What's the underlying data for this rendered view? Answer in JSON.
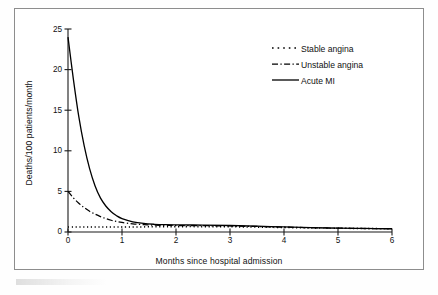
{
  "figure": {
    "border_color": "#8d8d8d",
    "background": "#ffffff",
    "ink_color": "#000000"
  },
  "chart_data": {
    "type": "line",
    "title": "",
    "subtitle": "",
    "xlabel": "Months since hospital admission",
    "ylabel": "Deaths/100 patients/month",
    "xlim": [
      0,
      6
    ],
    "ylim": [
      0,
      25
    ],
    "xticks": [
      0,
      1,
      2,
      3,
      4,
      5,
      6
    ],
    "yticks": [
      0,
      5,
      10,
      15,
      20,
      25
    ],
    "xtick_labels": [
      "0",
      "1",
      "2",
      "3",
      "4",
      "5",
      "6"
    ],
    "ytick_labels": [
      "0",
      "5",
      "10",
      "15",
      "20",
      "25"
    ],
    "grid": false,
    "legend_position": "upper right",
    "x": [
      0,
      0.1,
      0.2,
      0.3,
      0.4,
      0.5,
      0.6,
      0.7,
      0.8,
      0.9,
      1.0,
      1.2,
      1.4,
      1.6,
      1.8,
      2.0,
      2.5,
      3.0,
      3.5,
      4.0,
      4.5,
      5.0,
      5.5,
      6.0
    ],
    "series": [
      {
        "name": "Stable angina",
        "style": "dotted",
        "values": [
          0.62,
          0.62,
          0.62,
          0.62,
          0.62,
          0.62,
          0.62,
          0.62,
          0.62,
          0.62,
          0.62,
          0.62,
          0.63,
          0.64,
          0.65,
          0.66,
          0.66,
          0.64,
          0.6,
          0.55,
          0.5,
          0.46,
          0.43,
          0.4
        ]
      },
      {
        "name": "Unstable angina",
        "style": "dash-dot",
        "values": [
          5.0,
          4.2,
          3.55,
          3.0,
          2.55,
          2.2,
          1.9,
          1.65,
          1.45,
          1.3,
          1.18,
          1.0,
          0.9,
          0.85,
          0.82,
          0.8,
          0.78,
          0.74,
          0.68,
          0.6,
          0.53,
          0.47,
          0.43,
          0.4
        ]
      },
      {
        "name": "Acute MI",
        "style": "solid",
        "values": [
          24.0,
          18.8,
          14.2,
          10.6,
          7.8,
          5.7,
          4.2,
          3.2,
          2.5,
          2.0,
          1.65,
          1.25,
          1.05,
          0.95,
          0.9,
          0.88,
          0.85,
          0.8,
          0.72,
          0.62,
          0.54,
          0.48,
          0.44,
          0.4
        ]
      }
    ]
  },
  "legend": {
    "entries": [
      {
        "label": "Stable angina",
        "style": "dotted"
      },
      {
        "label": "Unstable angina",
        "style": "dash-dot"
      },
      {
        "label": "Acute MI",
        "style": "solid"
      }
    ]
  }
}
